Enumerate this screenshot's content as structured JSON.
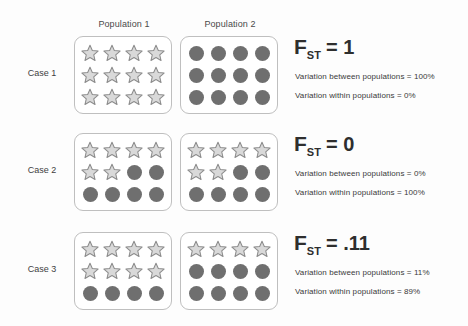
{
  "figure": {
    "background_color": "#fdfdfd",
    "star_fill": "#d9d9d9",
    "star_stroke": "#8c8c8c",
    "circle_fill": "#6f6f6f",
    "box_border": "#bfbfbf"
  },
  "columns": [
    {
      "label": "Population 1"
    },
    {
      "label": "Population 2"
    }
  ],
  "cases": [
    {
      "label": "Case 1",
      "fst_symbol": "F",
      "fst_subscript": "ST",
      "fst_value": "= 1",
      "variation_between": "Variation between populations = 100%",
      "variation_within": "Variation within populations = 0%",
      "populations": [
        {
          "name": "Population 1",
          "rows": [
            [
              "star",
              "star",
              "star",
              "star"
            ],
            [
              "star",
              "star",
              "star",
              "star"
            ],
            [
              "star",
              "star",
              "star",
              "star"
            ]
          ]
        },
        {
          "name": "Population 2",
          "rows": [
            [
              "circle",
              "circle",
              "circle",
              "circle"
            ],
            [
              "circle",
              "circle",
              "circle",
              "circle"
            ],
            [
              "circle",
              "circle",
              "circle",
              "circle"
            ]
          ]
        }
      ]
    },
    {
      "label": "Case 2",
      "fst_symbol": "F",
      "fst_subscript": "ST",
      "fst_value": "= 0",
      "variation_between": "Variation between populations = 0%",
      "variation_within": "Variation within populations = 100%",
      "populations": [
        {
          "name": "Population 1",
          "rows": [
            [
              "star",
              "star",
              "star",
              "star"
            ],
            [
              "star",
              "star",
              "circle",
              "circle"
            ],
            [
              "circle",
              "circle",
              "circle",
              "circle"
            ]
          ]
        },
        {
          "name": "Population 2",
          "rows": [
            [
              "star",
              "star",
              "star",
              "star"
            ],
            [
              "star",
              "star",
              "circle",
              "circle"
            ],
            [
              "circle",
              "circle",
              "circle",
              "circle"
            ]
          ]
        }
      ]
    },
    {
      "label": "Case 3",
      "fst_symbol": "F",
      "fst_subscript": "ST",
      "fst_value": "= .11",
      "variation_between": "Variation between populations = 11%",
      "variation_within": "Variation within populations = 89%",
      "populations": [
        {
          "name": "Population 1",
          "rows": [
            [
              "star",
              "star",
              "star",
              "star"
            ],
            [
              "star",
              "star",
              "star",
              "star"
            ],
            [
              "circle",
              "circle",
              "circle",
              "circle"
            ]
          ]
        },
        {
          "name": "Population 2",
          "rows": [
            [
              "star",
              "star",
              "star",
              "star"
            ],
            [
              "circle",
              "circle",
              "circle",
              "circle"
            ],
            [
              "circle",
              "circle",
              "circle",
              "circle"
            ]
          ]
        }
      ]
    }
  ]
}
